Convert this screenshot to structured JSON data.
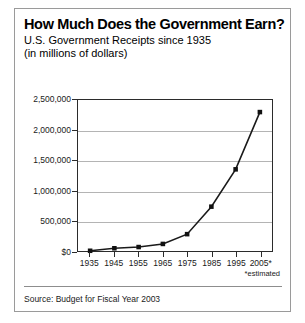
{
  "chart_data": {
    "type": "line",
    "title": "How Much Does the Government Earn?",
    "subtitle_line1": "U.S. Government Receipts since 1935",
    "subtitle_line2": "(in millions of dollars)",
    "xlabel": "",
    "ylabel": "",
    "categories": [
      "1935",
      "1945",
      "1955",
      "1965",
      "1975",
      "1985",
      "1995",
      "2005*"
    ],
    "values": [
      3700,
      45200,
      65500,
      117000,
      279000,
      734000,
      1352000,
      2300000
    ],
    "ylim": [
      0,
      2500000
    ],
    "xlim_labels": [
      "1935",
      "2005*"
    ],
    "ytick_labels": [
      "$0",
      "500,000",
      "1,000,000",
      "1,500,000",
      "2,000,000",
      "2,500,000"
    ],
    "ytick_values": [
      0,
      500000,
      1000000,
      1500000,
      2000000,
      2500000
    ],
    "grid": true,
    "legend": "none",
    "marker": "square",
    "annotations": [
      "*estimated"
    ],
    "source": "Source: Budget for Fiscal Year 2003",
    "colors": {
      "line": "#1a1a1a",
      "marker": "#111111",
      "grid": "#b4b4b4",
      "axis": "#2b2b2b",
      "border": "#9a9a9a",
      "background": "#ffffff"
    }
  },
  "footer": {
    "source_label": "Source: Budget for Fiscal Year 2003"
  },
  "notes": {
    "estimated": "*estimated"
  }
}
